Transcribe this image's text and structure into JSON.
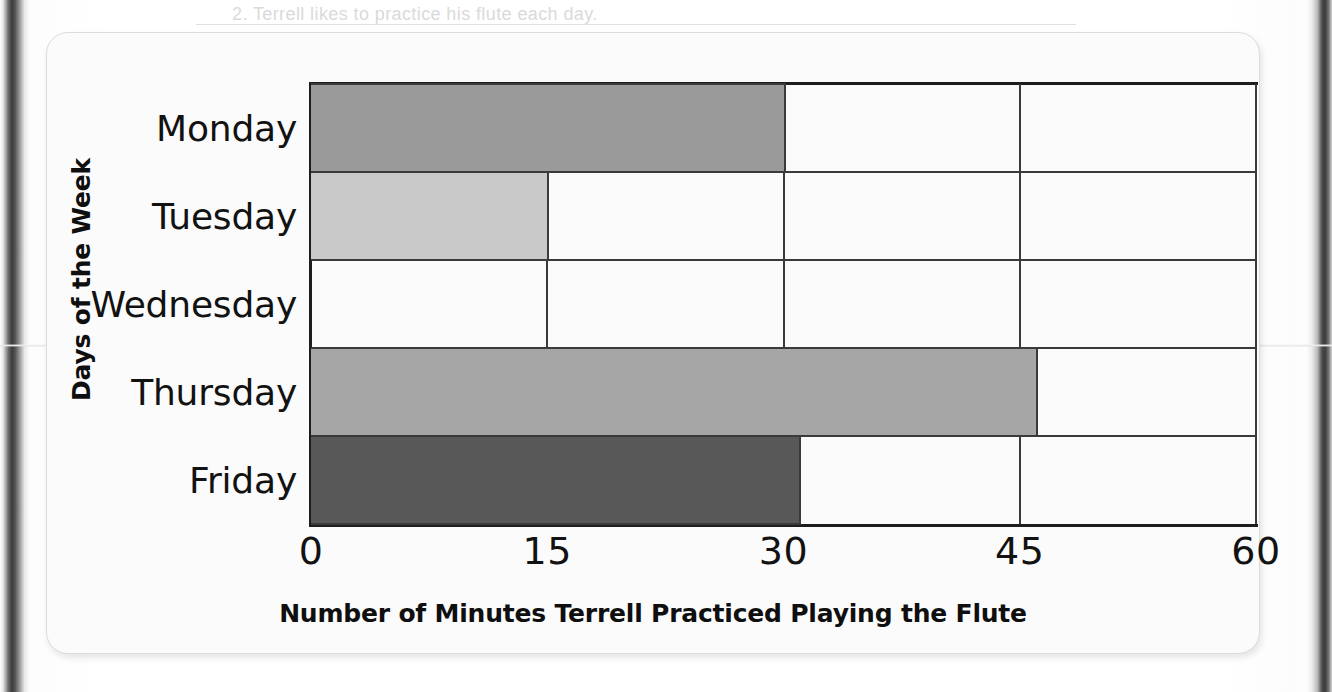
{
  "page": {
    "background_color": "#ffffff",
    "card_color": "#fbfbfb",
    "binding_shadow_color": "#3a3a3a"
  },
  "bleed_through": {
    "top_line": "2. Terrell likes to practice  his    flute  each  day.",
    "middle_numbers": "18    15    8    12    10    18    20    21",
    "question_2": "2. How many minutes did",
    "question_3": "3. and during how long did",
    "question_4": "4. the data above to"
  },
  "chart_data": {
    "type": "bar",
    "orientation": "horizontal",
    "title": "",
    "xlabel": "Number of Minutes Terrell Practiced Playing the Flute",
    "ylabel": "Days of the Week",
    "categories": [
      "Monday",
      "Tuesday",
      "Wednesday",
      "Thursday",
      "Friday"
    ],
    "values": [
      30,
      15,
      0,
      46,
      31
    ],
    "bar_colors": [
      "#9a9a9a",
      "#c9c9c9",
      "#ffffff",
      "#a6a6a6",
      "#585858"
    ],
    "xlim": [
      0,
      60
    ],
    "xticks": [
      0,
      15,
      30,
      45,
      60
    ],
    "xtick_labels": [
      "0",
      "15",
      "30",
      "45",
      "60"
    ],
    "grid": true,
    "grid_color": "#3a3a3a",
    "legend": false,
    "axis_color": "#1d1d1d"
  }
}
